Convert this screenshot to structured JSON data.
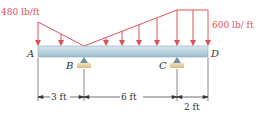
{
  "diagram": {
    "type": "beam-loading",
    "load_labels": {
      "left": "480 lb/ft",
      "right": "600 lb/ ft"
    },
    "points": {
      "A": "A",
      "B": "B",
      "C": "C",
      "D": "D"
    },
    "dimensions": {
      "AB": "3 ft",
      "BC": "6 ft",
      "CD": "2 ft"
    },
    "loads": {
      "at_A_lb_per_ft": 480,
      "at_B_lb_per_ft": 0,
      "at_C_lb_per_ft": 600,
      "at_D_lb_per_ft": 600
    },
    "colors": {
      "load": "#e0505a",
      "beam_top": "#c9dde8",
      "beam_bottom": "#9fbccd",
      "support_base": "#e8d3a8",
      "support_pin": "#6f8fa3",
      "dim_line": "#333333"
    }
  }
}
